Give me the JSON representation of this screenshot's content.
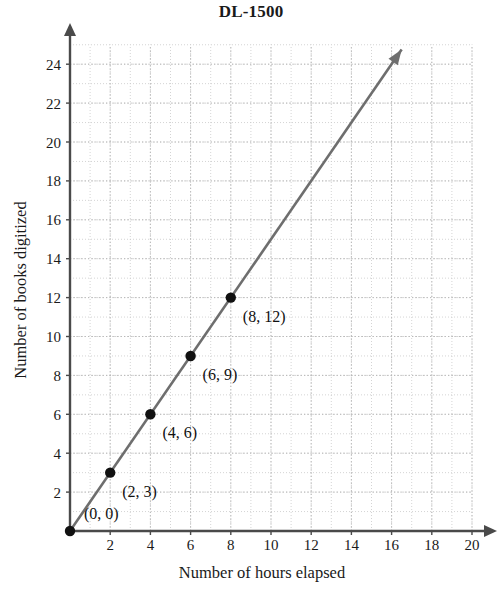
{
  "chart_data": {
    "type": "line",
    "title": "DL-1500",
    "xlabel": "Number of hours elapsed",
    "ylabel": "Number of books digitized",
    "xlim": [
      0,
      21
    ],
    "ylim": [
      0,
      25
    ],
    "grid": true,
    "legend": "none",
    "x_ticks": [
      2,
      4,
      6,
      8,
      10,
      12,
      14,
      16,
      18,
      20
    ],
    "y_ticks": [
      2,
      4,
      6,
      8,
      10,
      12,
      14,
      16,
      18,
      20,
      22,
      24
    ],
    "x_tick_labels": [
      "2",
      "4",
      "6",
      "8",
      "10",
      "12",
      "14",
      "16",
      "18",
      "20"
    ],
    "y_tick_labels": [
      "2",
      "4",
      "6",
      "8",
      "10",
      "12",
      "14",
      "16",
      "18",
      "20",
      "22",
      "24"
    ],
    "series": [
      {
        "name": "books digitized",
        "slope": 1.5,
        "x": [
          0,
          2,
          4,
          6,
          8
        ],
        "values": [
          0,
          3,
          6,
          9,
          12
        ],
        "line_end_x": 16.5,
        "line_end_y": 24.75,
        "arrow_at_end": true,
        "color": "#6e6e6e"
      }
    ],
    "point_labels": [
      {
        "text": "(0, 0)",
        "x": 0,
        "y": 0,
        "dx": 14,
        "dy": -12
      },
      {
        "text": "(2, 3)",
        "x": 2,
        "y": 3,
        "dx": 12,
        "dy": 24
      },
      {
        "text": "(4, 6)",
        "x": 4,
        "y": 6,
        "dx": 12,
        "dy": 24
      },
      {
        "text": "(6, 9)",
        "x": 6,
        "y": 9,
        "dx": 12,
        "dy": 24
      },
      {
        "text": "(8, 12)",
        "x": 8,
        "y": 12,
        "dx": 12,
        "dy": 24
      }
    ],
    "axis_arrows": {
      "x": true,
      "y": true
    },
    "colors": {
      "line": "#6e6e6e",
      "point": "#111111",
      "axis": "#4a4a4a",
      "grid_minor": "#c9c9c9",
      "grid_major": "#b4b4b4",
      "text": "#1a1a1a",
      "background": "#ffffff"
    }
  }
}
